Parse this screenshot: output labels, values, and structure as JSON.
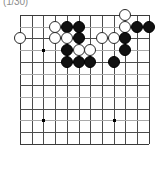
{
  "figure": {
    "caption": "(1/30)",
    "type": "go-board-diagram"
  },
  "board": {
    "name": "go-board",
    "visible_columns": 12,
    "visible_rows": 12,
    "origin_x": 20,
    "origin_y": 15,
    "spacing": 11.7,
    "line_color": "#4c4c4c",
    "edge_color": "#3a3a3a",
    "faint_line_color": "#a9a9a9",
    "background": "#ffffff",
    "faint_rows": [
      1,
      3,
      5,
      7,
      9,
      11
    ],
    "star_points": [
      {
        "col": 2,
        "row": 3,
        "label": "hoshi-upper-left"
      },
      {
        "col": 2,
        "row": 9,
        "label": "hoshi-lower-left"
      },
      {
        "col": 8,
        "row": 9,
        "label": "hoshi-lower-right"
      }
    ],
    "stones": [
      {
        "col": 9,
        "row": 0,
        "color": "white"
      },
      {
        "col": 3,
        "row": 1,
        "color": "white"
      },
      {
        "col": 4,
        "row": 1,
        "color": "black"
      },
      {
        "col": 5,
        "row": 1,
        "color": "black"
      },
      {
        "col": 9,
        "row": 1,
        "color": "white"
      },
      {
        "col": 10,
        "row": 1,
        "color": "black"
      },
      {
        "col": 11,
        "row": 1,
        "color": "black"
      },
      {
        "col": 0,
        "row": 2,
        "color": "white"
      },
      {
        "col": 3,
        "row": 2,
        "color": "white"
      },
      {
        "col": 4,
        "row": 2,
        "color": "white"
      },
      {
        "col": 5,
        "row": 2,
        "color": "black"
      },
      {
        "col": 7,
        "row": 2,
        "color": "white"
      },
      {
        "col": 8,
        "row": 2,
        "color": "white"
      },
      {
        "col": 9,
        "row": 2,
        "color": "black"
      },
      {
        "col": 4,
        "row": 3,
        "color": "black"
      },
      {
        "col": 5,
        "row": 3,
        "color": "white"
      },
      {
        "col": 6,
        "row": 3,
        "color": "white"
      },
      {
        "col": 9,
        "row": 3,
        "color": "black"
      },
      {
        "col": 4,
        "row": 4,
        "color": "black"
      },
      {
        "col": 5,
        "row": 4,
        "color": "black"
      },
      {
        "col": 6,
        "row": 4,
        "color": "black"
      },
      {
        "col": 8,
        "row": 4,
        "color": "black"
      }
    ],
    "stone_colors": {
      "black": "#111111",
      "white": "#ffffff",
      "white_outline": "#2a2a2a"
    }
  }
}
